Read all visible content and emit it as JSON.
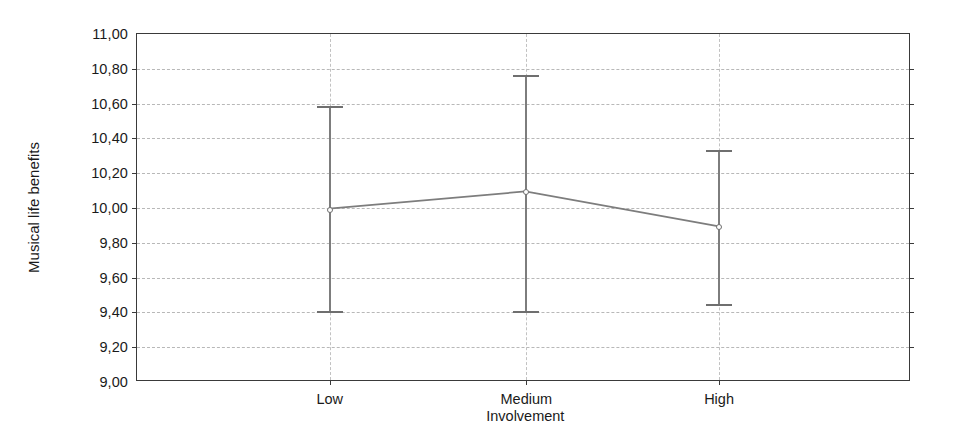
{
  "chart_data": {
    "type": "line",
    "title": "",
    "subtitle": "",
    "xlabel": "Involvement",
    "ylabel": "Musical life benefits",
    "categories": [
      "Low",
      "Medium",
      "High"
    ],
    "x_tick_labels": [
      "Low",
      "Medium",
      "High"
    ],
    "y_tick_labels": [
      "11,00",
      "10,80",
      "10,60",
      "10,40",
      "10,20",
      "10,00",
      "9,80",
      "9,60",
      "9,40",
      "9,20",
      "9,00"
    ],
    "y_tick_values": [
      11.0,
      10.8,
      10.6,
      10.4,
      10.2,
      10.0,
      9.8,
      9.6,
      9.4,
      9.2,
      9.0
    ],
    "ylim": [
      9.0,
      11.0
    ],
    "values": [
      9.99,
      10.09,
      9.89
    ],
    "error_bars": {
      "type": "95% CI",
      "lower": [
        9.4,
        9.4,
        9.44
      ],
      "upper": [
        10.58,
        10.76,
        10.33
      ]
    },
    "series": [
      {
        "name": "Musical life benefits",
        "values": [
          9.99,
          10.09,
          9.89
        ],
        "lower": [
          9.4,
          9.4,
          9.44
        ],
        "upper": [
          10.58,
          10.76,
          10.33
        ]
      }
    ],
    "grid": {
      "horizontal": true,
      "vertical": true,
      "style": "dotted",
      "color": "#b8b8b8"
    },
    "legend": {
      "visible": false,
      "position": "none",
      "entries": []
    },
    "colors": {
      "line": "#7d7d7d",
      "marker_edge": "#6f6f6f",
      "marker_face": "#ffffff",
      "error_bar": "#7d7d7d",
      "frame": "#3a3a3a",
      "grid": "#b8b8b8",
      "text": "#1a1a1a",
      "background": "#ffffff"
    },
    "points": [
      {
        "category": "Low",
        "mean": 9.99,
        "lower": 9.4,
        "upper": 10.58
      },
      {
        "category": "Medium",
        "mean": 10.09,
        "lower": 9.4,
        "upper": 10.76
      },
      {
        "category": "High",
        "mean": 9.89,
        "lower": 9.44,
        "upper": 10.33
      }
    ]
  }
}
